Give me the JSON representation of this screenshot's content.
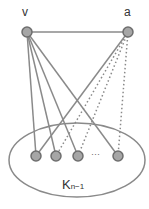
{
  "labels": {
    "v": "v",
    "a": "a",
    "clique_main": "K",
    "clique_sub": "n−1",
    "ellipsis": "···"
  },
  "colors": {
    "edge": "#8a8a8a",
    "node_fill": "#a6a6a6",
    "node_stroke": "#6e6e6e",
    "ellipse": "#8a8a8a",
    "text": "#333333"
  },
  "nodes": [
    {
      "id": "v",
      "x": 27,
      "y": 32
    },
    {
      "id": "a",
      "x": 128,
      "y": 32
    },
    {
      "id": "k1",
      "x": 36,
      "y": 156
    },
    {
      "id": "k2",
      "x": 56,
      "y": 156
    },
    {
      "id": "k3",
      "x": 78,
      "y": 156
    },
    {
      "id": "k4",
      "x": 118,
      "y": 156
    }
  ],
  "edges": [
    {
      "from": "v",
      "to": "a",
      "style": "solid"
    },
    {
      "from": "v",
      "to": "k1",
      "style": "solid"
    },
    {
      "from": "v",
      "to": "k2",
      "style": "solid"
    },
    {
      "from": "v",
      "to": "k3",
      "style": "solid"
    },
    {
      "from": "v",
      "to": "k4",
      "style": "solid"
    },
    {
      "from": "a",
      "to": "k1",
      "style": "solid"
    },
    {
      "from": "a",
      "to": "k2",
      "style": "dotted"
    },
    {
      "from": "a",
      "to": "k3",
      "style": "dotted"
    },
    {
      "from": "a",
      "to": "k4",
      "style": "dotted"
    }
  ]
}
